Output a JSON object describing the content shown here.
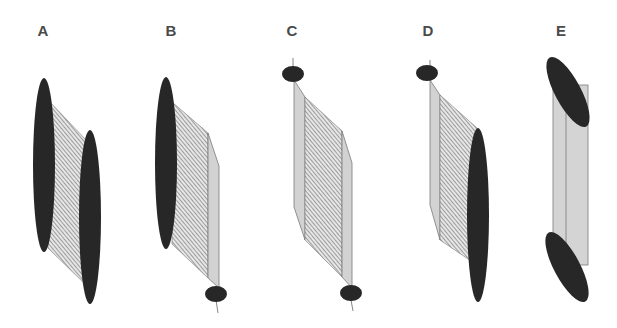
{
  "figure": {
    "panels": [
      {
        "id": "A",
        "label": "A",
        "description": "Two large dark ellipses connected by hatched surface"
      },
      {
        "id": "B",
        "label": "B",
        "description": "Large dark ellipse connected by hatched surface and gray strip to small ellipse"
      },
      {
        "id": "C",
        "label": "C",
        "description": "Two small ellipses connected by gray strips and hatched surface"
      },
      {
        "id": "D",
        "label": "D",
        "description": "Small ellipse connected by gray strip and hatched surface to large dark ellipse"
      },
      {
        "id": "E",
        "label": "E",
        "description": "Two tilted dark ellipses connected by gray cylinder"
      }
    ],
    "colors": {
      "ellipse_fill": "#2a2a2a",
      "strip_fill": "#d2d2d2",
      "hatch_bg": "#e4e4e4",
      "hatch_line": "#6a6a6a",
      "outline": "#7a7a7a",
      "label": "#4a4a4a"
    }
  }
}
